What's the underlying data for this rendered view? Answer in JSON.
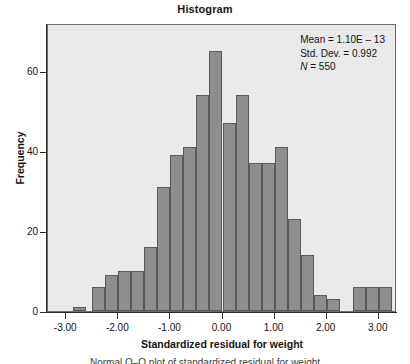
{
  "chart_data": {
    "type": "bar",
    "title": "Histogram",
    "xlabel": "Standardized residual for weight",
    "ylabel": "Frequency",
    "xlim": [
      -3.35,
      3.35
    ],
    "ylim": [
      0,
      72
    ],
    "grid": false,
    "legend": "none",
    "bin_width": 0.25,
    "x_ticks": [
      "-3.00",
      "-2.00",
      "-1.00",
      "0.00",
      "1.00",
      "2.00",
      "3.00"
    ],
    "x_tick_values": [
      -3,
      -2,
      -1,
      0,
      1,
      2,
      3
    ],
    "y_ticks": [
      "0",
      "20",
      "40",
      "60"
    ],
    "y_tick_values": [
      0,
      20,
      40,
      60
    ],
    "bin_centers": [
      -2.75,
      -2.375,
      -2.125,
      -1.875,
      -1.625,
      -1.375,
      -1.125,
      -0.875,
      -0.625,
      -0.375,
      -0.125,
      0.125,
      0.375,
      0.625,
      0.875,
      1.125,
      1.375,
      1.625,
      1.875,
      2.125,
      2.625,
      2.875,
      3.125
    ],
    "values": [
      1,
      6,
      9,
      10,
      10,
      16,
      31,
      39,
      41,
      54,
      65,
      47,
      54,
      37,
      37,
      41,
      23,
      14,
      4,
      3,
      6,
      6,
      6
    ],
    "bar_color": "#8e8e8e",
    "bar_edge_color": "#5a5a5a",
    "plot_background": "#e9e9e9",
    "axis_color": "#2b2b2b"
  },
  "annotation": {
    "mean_label": "Mean = 1.10E – 13",
    "std_label": "Std. Dev. = 0.992",
    "n_label_prefix": "N",
    "n_label_rest": " = 550"
  },
  "caption": {
    "text": "Normal Q–Q plot of standardized residual for weight"
  }
}
